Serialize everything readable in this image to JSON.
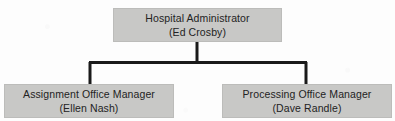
{
  "chart": {
    "type": "org-chart",
    "background_color": "#fdfdfd",
    "node_fill_color": "#c8c8c6",
    "node_border_color": "#bcbcba",
    "connector_color": "#1a1a1a",
    "text_color": "#232323"
  },
  "nodes": {
    "root": {
      "title": "Hospital Administrator",
      "person": "(Ed Crosby)"
    },
    "assignment": {
      "title": "Assignment Office Manager",
      "person": "(Ellen Nash)"
    },
    "processing": {
      "title": "Processing Office Manager",
      "person": "(Dave Randle)"
    }
  },
  "connectors": {
    "style": "orthogonal-elbow",
    "root_to_children": "Hospital Administrator branches down to Assignment Office Manager and Processing Office Manager"
  }
}
